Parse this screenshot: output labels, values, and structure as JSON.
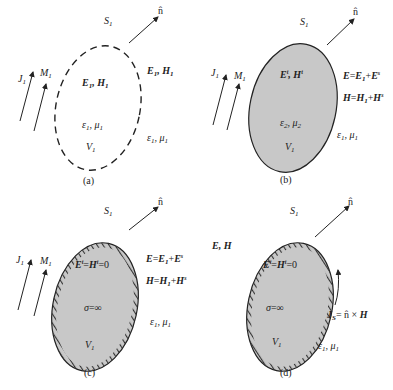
{
  "colors": {
    "ink": "#222222",
    "fill": "#c8c8c8",
    "hatch": "#333333",
    "background": "#ffffff"
  },
  "panels": [
    {
      "id": "a",
      "caption": "(a)",
      "surface": "S1",
      "surface_style": "dashed",
      "normal_label": "n̂",
      "sources": [
        "J1",
        "M1"
      ],
      "inside_field": "E1, H1",
      "inside_medium": "ε1, μ1",
      "volume": "V1",
      "outside_field": "E1, H1",
      "outside_medium": "ε1, μ1"
    },
    {
      "id": "b",
      "caption": "(b)",
      "surface": "S1",
      "surface_style": "solid-filled",
      "normal_label": "n̂",
      "sources": [
        "J1",
        "M1"
      ],
      "inside_field": "Eᵗ, Hᵗ",
      "inside_medium": "ε2, μ2",
      "volume": "V1",
      "outside_E": "E=E1+Eˢ",
      "outside_H": "H=H1+Hˢ",
      "outside_medium": "ε1, μ1"
    },
    {
      "id": "c",
      "caption": "(c)",
      "surface": "S1",
      "surface_style": "hatched-conductor",
      "normal_label": "n̂",
      "sources": [
        "J1",
        "M1"
      ],
      "inside_field": "Eᵗ=Hᵗ=0",
      "inside_sigma": "σ=∞",
      "volume": "V1",
      "outside_E": "E=E1+Eˢ",
      "outside_H": "H=H1+Hˢ",
      "outside_medium": "ε1, μ1"
    },
    {
      "id": "d",
      "caption": "(d)",
      "surface": "S1",
      "surface_style": "hatched-conductor",
      "normal_label": "n̂",
      "outside_field": "E, H",
      "inside_field": "Eᵗ=Hᵗ=0",
      "inside_sigma": "σ=∞",
      "volume": "V1",
      "surface_current": "JS= n̂ × H",
      "outside_medium": "ε1, μ1"
    }
  ]
}
